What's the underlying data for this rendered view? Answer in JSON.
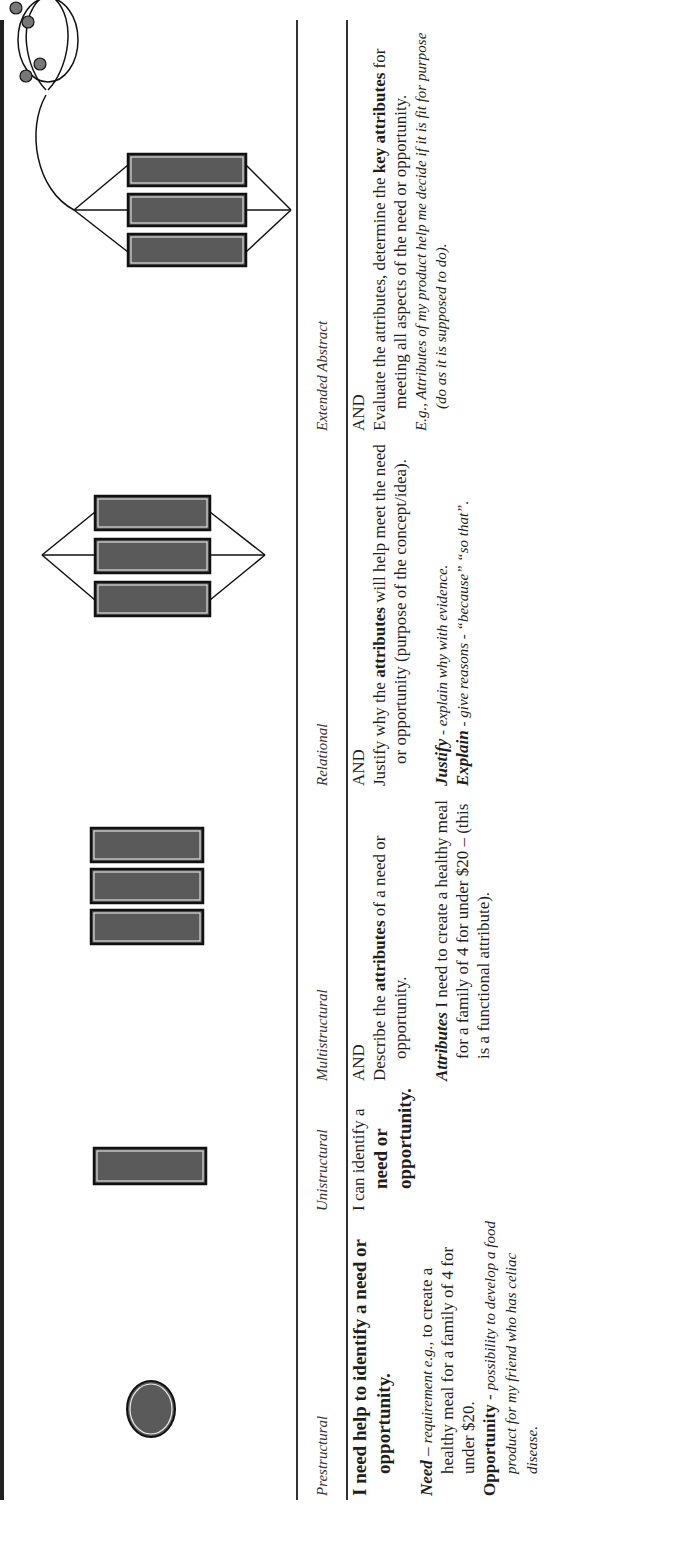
{
  "columns": [
    {
      "header": "Prestructural",
      "icon": "single-circle-icon",
      "statement_bold": "I need help to identify a need or opportunity.",
      "need_term": "Need",
      "need_dash": " – ",
      "need_italic": "requirement e.g.,",
      "need_rest": " to create a healthy meal for a family of 4 for under $20.",
      "opp_term": "Opportunity",
      "opp_dash": " - ",
      "opp_italic": "possibility to develop a food product for my friend who has celiac disease."
    },
    {
      "header": "Unistructural",
      "icon": "single-bar-icon",
      "statement_pre": "I can identify a ",
      "statement_bold": "need or opportunity."
    },
    {
      "header": "Multistructural",
      "icon": "three-bars-icon",
      "and": "AND",
      "statement_pre": "Describe the ",
      "statement_bold": "attributes",
      "statement_post": " of a need or opportunity.",
      "example_term": "Attributes",
      "example_rest": " I need to create a healthy meal for a family of 4 for under $20 – (this is a functional attribute)."
    },
    {
      "header": "Relational",
      "icon": "linked-bars-icon",
      "and": "AND",
      "statement_pre": "Justify why the ",
      "statement_bold": "attributes",
      "statement_post": " will help meet the need or opportunity (purpose of the concept/idea).",
      "justify_term": "Justify",
      "justify_rest": " - explain why with evidence.",
      "explain_term": "Explain",
      "explain_rest": " - give reasons - “because” “so that”."
    },
    {
      "header": "Extended Abstract",
      "icon": "linked-bars-with-network-icon",
      "and": "AND",
      "statement_pre": "Evaluate the attributes, determine the ",
      "statement_bold": "key attributes",
      "statement_post": " for meeting all aspects of the need or opportunity.",
      "example": "E.g., Attributes of my product help me decide if it is fit for purpose (do as it is supposed to do)."
    }
  ],
  "colors": {
    "ink": "#1e1e1e",
    "shape_fill": "#5a5a5a",
    "rule": "#333333"
  }
}
